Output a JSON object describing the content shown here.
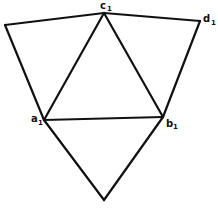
{
  "diagram": {
    "type": "geometric-net",
    "colors": {
      "background": "#ffffff",
      "stroke": "#111111"
    },
    "vertices": {
      "c1": {
        "x": 104,
        "y": 13,
        "label": "c",
        "subscript": "1"
      },
      "d1": {
        "x": 200,
        "y": 21,
        "label": "d",
        "subscript": "1"
      },
      "a1": {
        "x": 44,
        "y": 120,
        "label": "a",
        "subscript": "1"
      },
      "b1": {
        "x": 163,
        "y": 117,
        "label": "b",
        "subscript": "1"
      },
      "top_left": {
        "x": 5,
        "y": 25
      },
      "bottom": {
        "x": 104,
        "y": 200
      }
    },
    "labels": {
      "c1": {
        "letter": "c",
        "sub": "1"
      },
      "d1": {
        "letter": "d",
        "sub": "1"
      },
      "a1": {
        "letter": "a",
        "sub": "1"
      },
      "b1": {
        "letter": "b",
        "sub": "1"
      }
    },
    "edges": [
      [
        "top_left",
        "c1"
      ],
      [
        "c1",
        "d1"
      ],
      [
        "top_left",
        "a1"
      ],
      [
        "d1",
        "b1"
      ],
      [
        "a1",
        "c1"
      ],
      [
        "c1",
        "b1"
      ],
      [
        "a1",
        "b1"
      ],
      [
        "a1",
        "bottom"
      ],
      [
        "b1",
        "bottom"
      ]
    ]
  }
}
